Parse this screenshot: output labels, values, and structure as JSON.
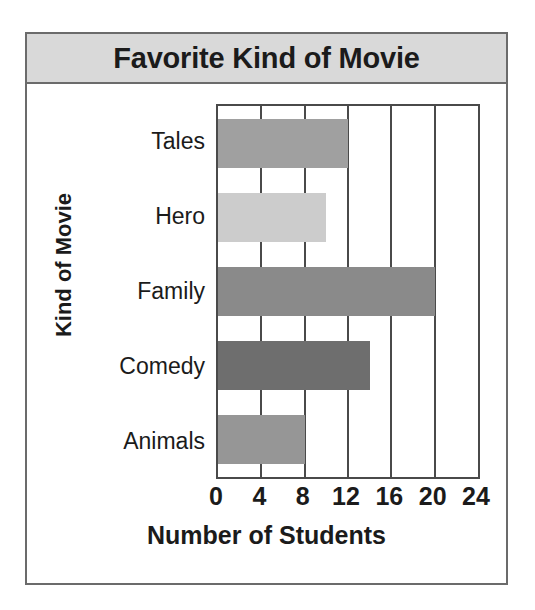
{
  "chart_data": {
    "type": "bar",
    "orientation": "horizontal",
    "title": "Favorite Kind of Movie",
    "xlabel": "Number of Students",
    "ylabel": "Kind of Movie",
    "categories": [
      "Tales",
      "Hero",
      "Family",
      "Comedy",
      "Animals"
    ],
    "values": [
      12,
      10,
      20,
      14,
      8
    ],
    "bar_colors": [
      "#a0a0a0",
      "#cccccc",
      "#8a8a8a",
      "#6e6e6e",
      "#969696"
    ],
    "xlim": [
      0,
      24
    ],
    "xticks": [
      0,
      4,
      8,
      12,
      16,
      20,
      24
    ],
    "xtick_labels": [
      "0",
      "4",
      "8",
      "12",
      "16",
      "20",
      "24"
    ],
    "grid": true,
    "grid_axis": "x",
    "legend": false
  },
  "style": {
    "title_banner_bg": "#d9d9d9",
    "border_color": "#6b6b6b",
    "axis_color": "#4a4a4a",
    "text_color": "#1b1b1b",
    "page_bg": "#ffffff"
  }
}
